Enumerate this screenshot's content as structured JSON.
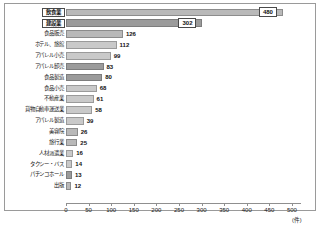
{
  "chart_data": {
    "type": "bar",
    "orientation": "horizontal",
    "title": "",
    "xlabel": "(件)",
    "ylabel": "",
    "xlim": [
      0,
      520
    ],
    "grid": false,
    "legend": null,
    "unit_label": "(件)",
    "xticks": [
      0,
      50,
      100,
      150,
      200,
      250,
      300,
      350,
      400,
      450,
      500
    ],
    "xtick_labels": [
      "0",
      "50",
      "100",
      "150",
      "200",
      "250",
      "300",
      "350",
      "400",
      "450",
      "500"
    ],
    "categories": [
      "飲食業",
      "建設業",
      "食品販売",
      "ホテル、旅館",
      "アパレル小売",
      "アパレル卸売",
      "食品製造",
      "食品小売",
      "不動産業",
      "貨物自動車運送業",
      "アパレル製造",
      "美容院",
      "旅行業",
      "人材派遣業",
      "タクシー・バス",
      "パチンコホール",
      "出版"
    ],
    "values": [
      480,
      302,
      126,
      112,
      99,
      83,
      80,
      68,
      61,
      58,
      39,
      26,
      25,
      16,
      14,
      13,
      12
    ],
    "highlighted": [
      "飲食業",
      "建設業"
    ],
    "colors": {
      "bar_light": "#c9c9c9",
      "bar_mid": "#b9b9b9",
      "bar_dark": "#9b9b9b",
      "border": "#8c8c8c",
      "text": "#1a1a1a",
      "frame": "#9a9a9a"
    },
    "shades": [
      "mid",
      "dark",
      "mid",
      "light",
      "light",
      "dark",
      "dark",
      "light",
      "light",
      "light",
      "light",
      "mid",
      "mid",
      "light",
      "light",
      "dark",
      "mid"
    ]
  }
}
